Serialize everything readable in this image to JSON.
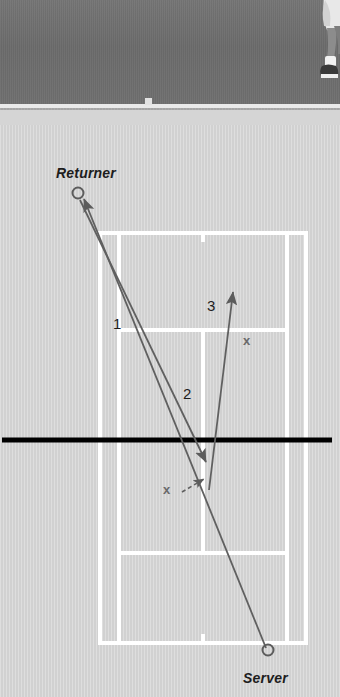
{
  "figure": {
    "type": "tennis-court-diagram",
    "canvas": {
      "width": 340,
      "height": 697
    },
    "colors": {
      "court_surface": "#d3d3d3",
      "court_line": "#ffffff",
      "net_line": "#000000",
      "trajectory_line": "#606060",
      "label_text": "#1d1d1d",
      "x_marker": "#6a6a6a",
      "photo_surface": "#6e6e6e",
      "photo_apron": "#a9a9a9"
    }
  },
  "photo": {
    "region_name": "tennis-court-photograph",
    "has_player": true,
    "player_description": "partial-player-legs-upper-right"
  },
  "players": [
    {
      "id": "returner",
      "label": "Returner",
      "x": 78,
      "y": 193,
      "side": "far-left"
    },
    {
      "id": "server",
      "label": "Server",
      "x": 268,
      "y": 650,
      "side": "near-right"
    }
  ],
  "shots": [
    {
      "number": "1",
      "label": "1",
      "label_x": 113,
      "label_y": 315,
      "description": "serve from server to returner",
      "from": "server",
      "to": "returner"
    },
    {
      "number": "2",
      "label": "2",
      "label_x": 183,
      "label_y": 385,
      "description": "return from returner to mid-court",
      "from": "returner",
      "to": "mid-court"
    },
    {
      "number": "3",
      "label": "3",
      "label_x": 207,
      "label_y": 297,
      "description": "next shot travelling away up the court",
      "from": "mid-court",
      "to": "deep-court"
    }
  ],
  "markers": [
    {
      "id": "x-marker-1",
      "label": "x",
      "x": 248,
      "y": 341,
      "note": "contact/target point high in service box"
    },
    {
      "id": "x-marker-2",
      "label": "x",
      "x": 168,
      "y": 489,
      "note": "bounce point near net with dashed arrow"
    }
  ],
  "net": {
    "label": "net",
    "y": 440,
    "x_start": 2,
    "x_end": 332
  },
  "court": {
    "name": "tennis-court",
    "doubles_left": 100,
    "doubles_right": 306,
    "baseline_far": 233,
    "baseline_near": 643,
    "singles_left": 119,
    "singles_right": 287,
    "service_line_far": 330,
    "service_line_near": 553,
    "has_center_mark": true,
    "has_center_service_line": true
  }
}
